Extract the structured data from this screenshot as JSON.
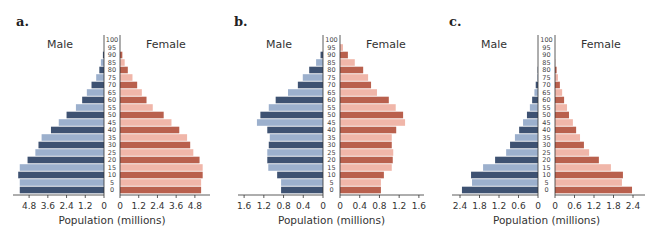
{
  "colors": {
    "male_dark": "#3e5272",
    "male_light": "#9cb0cd",
    "female_dark": "#b9604d",
    "female_light": "#f0b6a9",
    "axis": "#333333"
  },
  "age_groups": [
    0,
    5,
    10,
    15,
    20,
    25,
    30,
    35,
    40,
    45,
    50,
    55,
    60,
    65,
    70,
    75,
    80,
    85,
    90,
    95,
    100
  ],
  "chart_data": [
    {
      "type": "bar",
      "subtype": "population-pyramid",
      "panel": "a.",
      "title": "",
      "left_label": "Male",
      "right_label": "Female",
      "xlabel": "Population (millions)",
      "ylabel": "Age",
      "categories": [
        "0",
        "5",
        "10",
        "15",
        "20",
        "25",
        "30",
        "35",
        "40",
        "45",
        "50",
        "55",
        "60",
        "65",
        "70",
        "75",
        "80",
        "85",
        "90",
        "95",
        "100"
      ],
      "ticks": [
        4.8,
        3.6,
        2.4,
        1.2,
        0
      ],
      "tick_labels_male": [
        "4.8",
        "3.6",
        "2.4",
        "1.2",
        "0"
      ],
      "tick_labels_female": [
        "0",
        "1.2",
        "2.4",
        "3.6",
        "4.8"
      ],
      "xlim": [
        0,
        5.4
      ],
      "series": [
        {
          "name": "Male",
          "values": [
            5.4,
            5.4,
            5.5,
            5.4,
            4.9,
            4.4,
            4.2,
            4.0,
            3.4,
            2.9,
            2.4,
            1.8,
            1.4,
            1.1,
            0.8,
            0.5,
            0.3,
            0.2,
            0.07,
            0,
            0
          ]
        },
        {
          "name": "Female",
          "values": [
            5.2,
            5.2,
            5.3,
            5.3,
            5.1,
            4.7,
            4.5,
            4.3,
            3.8,
            3.3,
            2.8,
            2.1,
            1.7,
            1.4,
            1.1,
            0.8,
            0.5,
            0.3,
            0.15,
            0,
            0
          ]
        }
      ]
    },
    {
      "type": "bar",
      "subtype": "population-pyramid",
      "panel": "b.",
      "title": "",
      "left_label": "Male",
      "right_label": "Female",
      "xlabel": "Population (millions)",
      "ylabel": "Age",
      "categories": [
        "0",
        "5",
        "10",
        "15",
        "20",
        "25",
        "30",
        "35",
        "40",
        "45",
        "50",
        "55",
        "60",
        "65",
        "70",
        "75",
        "80",
        "85",
        "90",
        "95",
        "100"
      ],
      "ticks": [
        1.6,
        1.2,
        0.8,
        0.4,
        0
      ],
      "tick_labels_male": [
        "1.6",
        "1.2",
        "0.8",
        "0.4",
        "0"
      ],
      "tick_labels_female": [
        "0",
        "0.4",
        "0.8",
        "1.2",
        "1.6"
      ],
      "xlim": [
        0,
        1.7
      ],
      "series": [
        {
          "name": "Male",
          "values": [
            0.85,
            0.85,
            0.93,
            1.11,
            1.13,
            1.13,
            1.1,
            1.08,
            1.13,
            1.34,
            1.27,
            1.1,
            0.96,
            0.71,
            0.51,
            0.41,
            0.28,
            0.14,
            0.05,
            0,
            0
          ]
        },
        {
          "name": "Female",
          "values": [
            0.83,
            0.83,
            0.89,
            1.05,
            1.07,
            1.08,
            1.05,
            1.05,
            1.14,
            1.32,
            1.28,
            1.13,
            0.99,
            0.75,
            0.63,
            0.57,
            0.47,
            0.3,
            0.16,
            0.06,
            0
          ]
        }
      ]
    },
    {
      "type": "bar",
      "subtype": "population-pyramid",
      "panel": "c.",
      "title": "",
      "left_label": "Male",
      "right_label": "Female",
      "xlabel": "Population (millions)",
      "ylabel": "Age",
      "categories": [
        "0",
        "5",
        "10",
        "15",
        "20",
        "25",
        "30",
        "35",
        "40",
        "45",
        "50",
        "55",
        "60",
        "65",
        "70",
        "75",
        "80",
        "85",
        "90",
        "95",
        "100"
      ],
      "ticks": [
        2.4,
        1.8,
        1.2,
        0.6,
        0
      ],
      "tick_labels_male": [
        "2.4",
        "1.8",
        "1.2",
        "0.6",
        "0"
      ],
      "tick_labels_female": [
        "0",
        "0.6",
        "1.2",
        "1.8",
        "2.4"
      ],
      "xlim": [
        0,
        2.55
      ],
      "series": [
        {
          "name": "Male",
          "values": [
            2.34,
            2.03,
            2.06,
            1.69,
            1.32,
            0.98,
            0.86,
            0.71,
            0.58,
            0.46,
            0.34,
            0.25,
            0.18,
            0.11,
            0.07,
            0.02,
            0.01,
            0,
            0,
            0,
            0
          ]
        },
        {
          "name": "Female",
          "values": [
            2.37,
            2.06,
            2.09,
            1.72,
            1.35,
            1.05,
            0.89,
            0.77,
            0.65,
            0.55,
            0.43,
            0.37,
            0.28,
            0.22,
            0.15,
            0.09,
            0.05,
            0.01,
            0,
            0,
            0
          ]
        }
      ]
    }
  ],
  "layout": [
    {
      "offset": 0,
      "letter_x": 16,
      "male_zero": 104,
      "female_zero": 120,
      "px_per_unit": 15.6,
      "axis_left": 13,
      "axis_right": 210
    },
    {
      "offset": 0,
      "letter_x": 234,
      "male_zero": 323,
      "female_zero": 340,
      "px_per_unit": 49.3,
      "axis_left": 238,
      "axis_right": 424
    },
    {
      "offset": 0,
      "letter_x": 449,
      "male_zero": 538,
      "female_zero": 555,
      "px_per_unit": 32.5,
      "axis_left": 452,
      "axis_right": 645
    }
  ]
}
